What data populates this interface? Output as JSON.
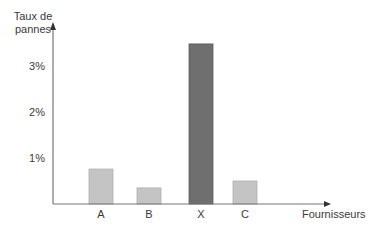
{
  "chart_data": {
    "type": "bar",
    "title": "",
    "ylabel": "Taux de pannes",
    "ylabel_lines": [
      "Taux de",
      "pannes"
    ],
    "xlabel": "Fournisseurs",
    "categories": [
      "A",
      "B",
      "X",
      "C"
    ],
    "values": [
      0.76,
      0.35,
      3.48,
      0.5
    ],
    "unit": "%",
    "yticks": [
      {
        "value": 1,
        "label": "1%"
      },
      {
        "value": 2,
        "label": "2%"
      },
      {
        "value": 3,
        "label": "3%"
      }
    ],
    "ylim": [
      0,
      3.9
    ],
    "grid": false,
    "legend": null,
    "colors": {
      "A": "#c4c4c4",
      "B": "#c4c4c4",
      "X": "#6f6f6f",
      "C": "#c4c4c4",
      "axis": "#777777",
      "edge": "#b0b0b0"
    }
  }
}
